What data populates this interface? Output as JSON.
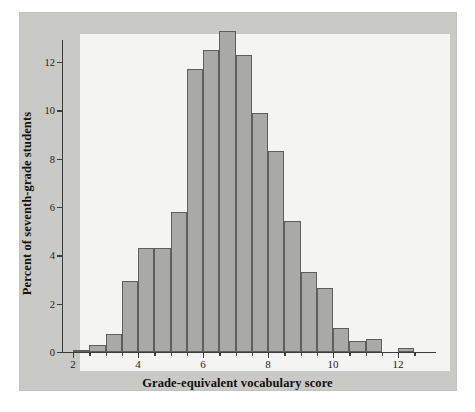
{
  "figure": {
    "background_color": "#ffffff",
    "panel_color": "#c9c9c6",
    "canvas_color": "#f4f4f2",
    "bar_fill": "#a9a9a6",
    "bar_stroke": "#5e5e5c",
    "axis_color": "#3c3c3c"
  },
  "chart_data": {
    "type": "bar",
    "title": "",
    "xlabel": "Grade-equivalent vocabulary score",
    "ylabel": "Percent of seventh-grade students",
    "xlim": [
      1.6,
      12.9
    ],
    "ylim": [
      0,
      13.7
    ],
    "grid": false,
    "legend": null,
    "bin_width": 0.5,
    "xticks": [
      2,
      4,
      6,
      8,
      10,
      12
    ],
    "xtick_labels": [
      "2",
      "4",
      "6",
      "8",
      "10",
      "12"
    ],
    "yticks": [
      0,
      2,
      4,
      6,
      8,
      10,
      12
    ],
    "ytick_labels": [
      "0",
      "2",
      "4",
      "6",
      "8",
      "10",
      "12"
    ],
    "bin_starts": [
      2.0,
      2.5,
      3.0,
      3.5,
      4.0,
      4.5,
      5.0,
      5.5,
      6.0,
      6.5,
      7.0,
      7.5,
      8.0,
      8.5,
      9.0,
      9.5,
      10.0,
      10.5,
      11.0,
      12.0
    ],
    "categories": [
      "2.0-2.5",
      "2.5-3.0",
      "3.0-3.5",
      "3.5-4.0",
      "4.0-4.5",
      "4.5-5.0",
      "5.0-5.5",
      "5.5-6.0",
      "6.0-6.5",
      "6.5-7.0",
      "7.0-7.5",
      "7.5-8.0",
      "8.0-8.5",
      "8.5-9.0",
      "9.0-9.5",
      "9.5-10.0",
      "10.0-10.5",
      "10.5-11.0",
      "11.0-11.5",
      "12.0-12.5"
    ],
    "values": [
      0.1,
      0.3,
      0.75,
      2.95,
      4.3,
      4.3,
      5.8,
      11.7,
      12.5,
      13.3,
      12.3,
      9.9,
      8.3,
      5.4,
      3.3,
      2.65,
      1.0,
      0.45,
      0.55,
      0.15
    ]
  }
}
